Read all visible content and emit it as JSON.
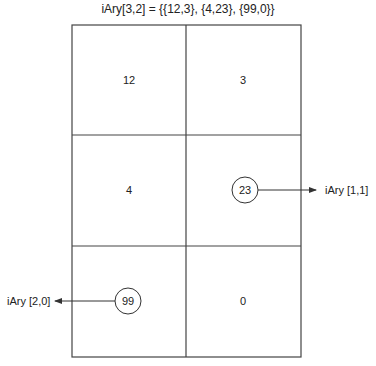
{
  "title": "iAry[3,2] = {{12,3}, {4,23}, {99,0}}",
  "array": {
    "name": "iAry",
    "dimensions": [
      3,
      2
    ],
    "rows": [
      [
        12,
        3
      ],
      [
        4,
        23
      ],
      [
        99,
        0
      ]
    ]
  },
  "cells": {
    "r0c0": "12",
    "r0c1": "3",
    "r1c0": "4",
    "r1c1": "23",
    "r2c0": "99",
    "r2c1": "0"
  },
  "callouts": [
    {
      "index": "iAry [1,1]",
      "value": "23",
      "direction": "right"
    },
    {
      "index": "iAry [2,0]",
      "value": "99",
      "direction": "left"
    }
  ],
  "labels": {
    "callout_1_1": "iAry [1,1]",
    "callout_2_0": "iAry [2,0]"
  }
}
